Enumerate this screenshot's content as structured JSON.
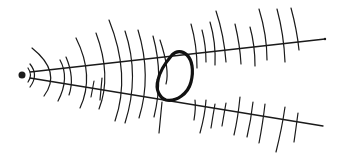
{
  "diagram": {
    "colors": {
      "ink": "#1a1a1a",
      "background": "#ffffff"
    },
    "source": {
      "cx": 22,
      "cy": 75,
      "r": 3.5
    },
    "rays": [
      {
        "x1": 30,
        "y1": 72,
        "x2": 325,
        "y2": 39
      },
      {
        "x1": 30,
        "y1": 78,
        "x2": 323,
        "y2": 126
      }
    ],
    "obstacle": {
      "label": ""
    }
  }
}
